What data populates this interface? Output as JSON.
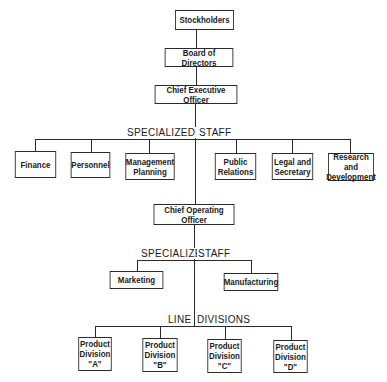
{
  "chart": {
    "top": {
      "stockholders": "Stockholders",
      "board": "Board of Directors",
      "ceo": "Chief Executive Officer"
    },
    "specialized_staff_1": {
      "label_left": "SPECIALIZED",
      "label_right": "STAFF",
      "units": [
        "Finance",
        "Personnel",
        "Management\nPlanning",
        "Public\nRelations",
        "Legal and\nSecretary",
        "Research and\nDevelopment"
      ]
    },
    "coo": "Chief Operating Officer",
    "specialized_staff_2": {
      "label_left": "SPECIALIZED",
      "label_right": "STAFF",
      "units": [
        "Marketing",
        "Manufacturing"
      ]
    },
    "line_divisions": {
      "label_left": "LINE",
      "label_right": "DIVISIONS",
      "units": [
        "Product\nDivision\n\"A\"",
        "Product\nDivision\n\"B\"",
        "Product\nDivision\n\"C\"",
        "Product\nDivision\n\"D\""
      ]
    }
  }
}
